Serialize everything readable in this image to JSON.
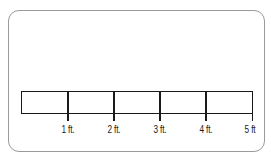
{
  "diagram": {
    "type": "scale-bar",
    "segments": 5,
    "labels": [
      "1 ft.",
      "2 ft.",
      "3 ft.",
      "4 ft.",
      "5 ft"
    ],
    "colors": {
      "line": "#1a1a1a",
      "border": "#9a9a9a",
      "background": "#ffffff"
    }
  }
}
